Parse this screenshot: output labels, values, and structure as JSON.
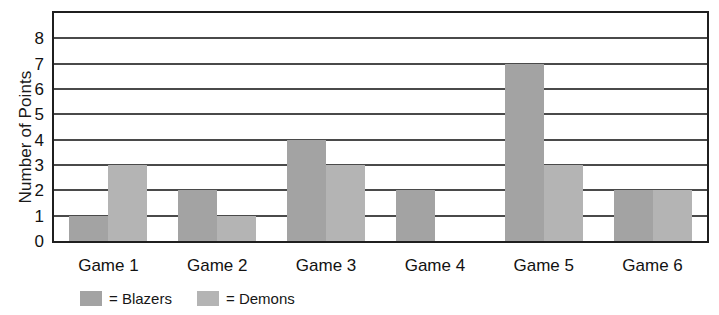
{
  "chart_data": {
    "type": "bar",
    "title": "",
    "xlabel": "",
    "ylabel": "Number of Points",
    "categories": [
      "Game 1",
      "Game 2",
      "Game 3",
      "Game 4",
      "Game 5",
      "Game 6"
    ],
    "series": [
      {
        "name": "Blazers",
        "values": [
          1,
          2,
          4,
          2,
          7,
          2
        ],
        "color": "#a3a3a3"
      },
      {
        "name": "Demons",
        "values": [
          3,
          1,
          3,
          0,
          3,
          2
        ],
        "color": "#b4b4b4"
      }
    ],
    "ylim": [
      0,
      9
    ],
    "yticks": [
      0,
      1,
      2,
      3,
      4,
      5,
      6,
      7,
      8
    ],
    "ytick_labels": [
      "0",
      "1",
      "2",
      "3",
      "4",
      "5",
      "6",
      "7",
      "8"
    ],
    "grid": true,
    "grid_axis": "y",
    "legend_position": "bottom-left",
    "legend_entries": [
      {
        "label": "= Blazers",
        "name": "Blazers"
      },
      {
        "label": "= Demons",
        "name": "Demons"
      }
    ]
  }
}
